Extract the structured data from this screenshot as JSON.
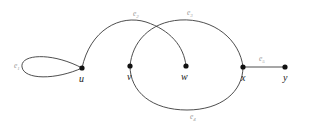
{
  "figure": {
    "type": "undirected-multigraph-drawing",
    "width": 311,
    "height": 131,
    "background_color": "#ffffff",
    "edge_color": "#3a3a3a",
    "vertex_color": "#111111",
    "edge_label_color": "#9a9a9a",
    "vertex_label_color": "#1a1a1a"
  },
  "vertices": [
    {
      "id": "u",
      "label": "u",
      "x": 82,
      "y": 68,
      "label_x": 79,
      "label_y": 82
    },
    {
      "id": "v",
      "label": "v",
      "x": 130,
      "y": 66,
      "label_x": 127,
      "label_y": 80
    },
    {
      "id": "w",
      "label": "w",
      "x": 186,
      "y": 66,
      "label_x": 181,
      "label_y": 80
    },
    {
      "id": "x",
      "label": "x",
      "x": 243,
      "y": 67,
      "label_x": 241,
      "label_y": 81
    },
    {
      "id": "y",
      "label": "y",
      "x": 285,
      "y": 67,
      "label_x": 283,
      "label_y": 81
    }
  ],
  "edges": [
    {
      "id": "e1",
      "base": "e",
      "subscript": "1",
      "endpoints": [
        "u",
        "u"
      ],
      "kind": "self-loop",
      "label_x": 14,
      "label_y": 68
    },
    {
      "id": "e2",
      "base": "e",
      "subscript": "2",
      "endpoints": [
        "u",
        "w"
      ],
      "kind": "arc-above",
      "label_x": 133,
      "label_y": 16
    },
    {
      "id": "e3",
      "base": "e",
      "subscript": "3",
      "endpoints": [
        "v",
        "x"
      ],
      "kind": "arc-above",
      "label_x": 187,
      "label_y": 15
    },
    {
      "id": "e4",
      "base": "e",
      "subscript": "4",
      "endpoints": [
        "v",
        "x"
      ],
      "kind": "arc-below",
      "label_x": 190,
      "label_y": 119
    },
    {
      "id": "e5",
      "base": "e",
      "subscript": "5",
      "endpoints": [
        "x",
        "y"
      ],
      "kind": "straight",
      "label_x": 259,
      "label_y": 61
    }
  ]
}
